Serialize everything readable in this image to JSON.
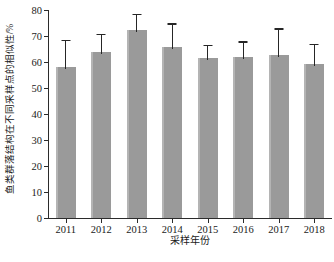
{
  "chart_data": {
    "type": "bar",
    "title": "",
    "subtitle": "",
    "xlabel": "采样年份",
    "ylabel": "鱼类群落结构在不同采样点的相似性/%",
    "categories": [
      "2011",
      "2012",
      "2013",
      "2014",
      "2015",
      "2016",
      "2017",
      "2018"
    ],
    "values": [
      58.2,
      64.0,
      72.3,
      65.6,
      61.6,
      61.8,
      62.7,
      59.3
    ],
    "errors_upper": [
      10.3,
      6.9,
      6.3,
      9.3,
      5.0,
      6.1,
      10.2,
      7.7
    ],
    "errors_lower": [
      0,
      0,
      0,
      0,
      0,
      0,
      0,
      0
    ],
    "error_style": "upper-only-whisker",
    "ylim": [
      0,
      80
    ],
    "yticks": [
      0,
      10,
      20,
      30,
      40,
      50,
      60,
      70,
      80
    ],
    "ytick_labels": [
      "0",
      "10",
      "20",
      "30",
      "40",
      "50",
      "60",
      "70",
      "80"
    ],
    "grid": false,
    "legend": "none",
    "bar_color": "#9a9a9a",
    "error_color": "#262626",
    "axis_color": "#2b2b2b"
  },
  "axes": {
    "y_title": "鱼类群落结构在不同采样点的相似性/%",
    "x_title": "采样年份"
  }
}
